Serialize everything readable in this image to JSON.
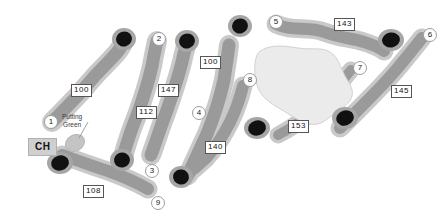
{
  "map": {
    "title": "Golf Course Layout Map",
    "width": 448,
    "height": 222,
    "background_color": "#ffffff"
  },
  "colors": {
    "rough": "#c9c9c9",
    "fairway": "#9a9a9a",
    "green": "#111111",
    "water": "#ebebeb",
    "water_outline": "#cfcfcf",
    "label_text": "#111111",
    "marker_border": "#9d9d9d"
  },
  "clubhouse": {
    "label": "CH",
    "x": 28,
    "y": 138
  },
  "putting_green": {
    "label_line1": "Putting",
    "label_line2": "Green",
    "x": 80,
    "y": 113
  },
  "holes": [
    {
      "number": "1",
      "yardage": "100",
      "marker_x": 44,
      "marker_y": 115,
      "yardage_x": 71,
      "yardage_y": 84
    },
    {
      "number": "2",
      "yardage": "112",
      "marker_x": 152,
      "marker_y": 32,
      "yardage_x": 136,
      "yardage_y": 106
    },
    {
      "number": "3",
      "yardage": "147",
      "marker_x": 145,
      "marker_y": 164,
      "yardage_x": 158,
      "yardage_y": 84
    },
    {
      "number": "4",
      "yardage": "100",
      "marker_x": 192,
      "marker_y": 106,
      "yardage_x": 200,
      "yardage_y": 56
    },
    {
      "number": "5",
      "yardage": "143",
      "marker_x": 269,
      "marker_y": 15,
      "yardage_x": 334,
      "yardage_y": 18
    },
    {
      "number": "6",
      "yardage": "145",
      "marker_x": 423,
      "marker_y": 28,
      "yardage_x": 391,
      "yardage_y": 85
    },
    {
      "number": "7",
      "yardage": "153",
      "marker_x": 353,
      "marker_y": 61,
      "yardage_x": 288,
      "yardage_y": 120
    },
    {
      "number": "8",
      "yardage": "140",
      "marker_x": 243,
      "marker_y": 73,
      "yardage_x": 205,
      "yardage_y": 141
    },
    {
      "number": "9",
      "yardage": "108",
      "marker_x": 151,
      "marker_y": 196,
      "yardage_x": 83,
      "yardage_y": 185
    }
  ],
  "features": {
    "water_hazard_name": "water-hazard",
    "rough_layer_name": "rough",
    "fairway_layer_name": "fairways",
    "greens_layer_name": "greens"
  }
}
